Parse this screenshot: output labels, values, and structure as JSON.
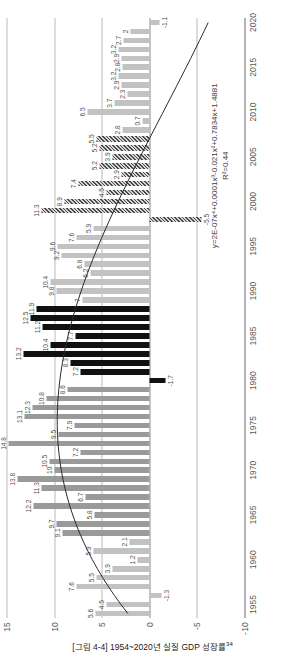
{
  "caption": {
    "text": "[그림 4-4] 1954~2020년 실질 GDP 성장률",
    "footnote_marker": "34"
  },
  "annotations": {
    "equation": "y=2E-07x⁴+0.0001x³-0.021x²+0.7834x+1.4881",
    "r_squared": "R²=0.44"
  },
  "axis": {
    "y_ticks": [
      "15",
      "10",
      "5",
      "0",
      "-5",
      "-10"
    ],
    "y_values": [
      15,
      10,
      5,
      0,
      -5,
      -10
    ],
    "x_ticks": [
      "1955",
      "1960",
      "1965",
      "1970",
      "1975",
      "1980",
      "1985",
      "1990",
      "1995",
      "2000",
      "2005",
      "2010",
      "2015",
      "2020"
    ]
  },
  "chart_data": {
    "type": "bar",
    "title": "[그림 4-4] 1954~2020년 실질 GDP 성장률",
    "xlabel": "",
    "ylabel": "",
    "ylim": [
      -10,
      15
    ],
    "grid": true,
    "legend": "none",
    "trendline": {
      "type": "polynomial",
      "order": 4,
      "equation": "y=2E-07x⁴+0.0001x³-0.021x²+0.7834x+1.4881",
      "r_squared": 0.44
    },
    "categories": [
      1954,
      1955,
      1956,
      1957,
      1958,
      1959,
      1960,
      1961,
      1962,
      1963,
      1964,
      1965,
      1966,
      1967,
      1968,
      1969,
      1970,
      1971,
      1972,
      1973,
      1974,
      1975,
      1976,
      1977,
      1978,
      1979,
      1980,
      1981,
      1982,
      1983,
      1984,
      1985,
      1986,
      1987,
      1988,
      1989,
      1990,
      1991,
      1992,
      1993,
      1994,
      1995,
      1996,
      1997,
      1998,
      1999,
      2000,
      2001,
      2002,
      2003,
      2004,
      2005,
      2006,
      2007,
      2008,
      2009,
      2010,
      2011,
      2012,
      2013,
      2014,
      2015,
      2016,
      2017,
      2018,
      2019,
      2020
    ],
    "values": [
      5.6,
      4.5,
      -1.3,
      7.6,
      5.5,
      3.9,
      1.2,
      5.9,
      2.1,
      9.1,
      9.7,
      5.8,
      12.2,
      6.7,
      11.3,
      13.8,
      10.0,
      10.5,
      7.2,
      14.8,
      9.5,
      7.9,
      13.1,
      12.3,
      10.8,
      8.6,
      -1.7,
      7.2,
      8.3,
      13.2,
      10.4,
      7.7,
      11.2,
      12.5,
      11.9,
      7.0,
      9.8,
      10.4,
      6.2,
      6.8,
      9.2,
      9.6,
      7.6,
      5.9,
      -5.5,
      11.3,
      8.9,
      4.5,
      7.4,
      2.9,
      5.2,
      3.9,
      5.2,
      5.5,
      2.8,
      0.7,
      6.5,
      3.7,
      2.3,
      2.9,
      3.2,
      2.8,
      2.9,
      3.2,
      2.7,
      2.0,
      -1.1
    ],
    "series_style_groups": [
      {
        "name": "1954-1962",
        "style": "light-gray"
      },
      {
        "name": "1963-1979",
        "style": "solid-gray"
      },
      {
        "name": "1980-1988",
        "style": "black"
      },
      {
        "name": "1989-1997",
        "style": "light-gray"
      },
      {
        "name": "1998-2007",
        "style": "hatch"
      },
      {
        "name": "2008-2020",
        "style": "light-gray"
      }
    ],
    "data_labels": [
      "5.6",
      "4.5",
      "-1.3",
      "7.6",
      "5.5",
      "3.9",
      "1.2",
      "5.9",
      "2.1",
      "9.1",
      "9.7",
      "5.8",
      "12.2",
      "6.7",
      "11.3",
      "13.8",
      "10",
      "10.5",
      "7.2",
      "14.8",
      "9.5",
      "7.9",
      "13.1",
      "12.3",
      "10.8",
      "8.6",
      "-1.7",
      "7.2",
      "8.3",
      "13.2",
      "10.4",
      "7.7",
      "11.2",
      "12.5",
      "11.9",
      "7",
      "9.8",
      "10.4",
      "6.2",
      "6.8",
      "9.2",
      "9.6",
      "7.6",
      "5.9",
      "-5.5",
      "11.3",
      "8.9",
      "4.5",
      "7.4",
      "2.9",
      "5.2",
      "3.9",
      "5.2",
      "5.5",
      "2.8",
      "0.7",
      "6.5",
      "3.7",
      "2.3",
      "2.9",
      "3.2",
      "2.8",
      "2.9",
      "3.2",
      "2.7",
      "2",
      "-1.1"
    ]
  }
}
